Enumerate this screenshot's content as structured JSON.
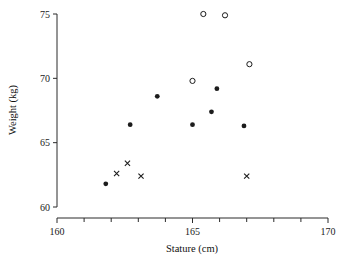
{
  "chart_data": {
    "type": "scatter",
    "title": "",
    "xlabel": "Stature (cm)",
    "ylabel": "Weight (kg)",
    "xlim": [
      160,
      170
    ],
    "ylim": [
      60,
      75
    ],
    "xticks": [
      160,
      165,
      170
    ],
    "xtick_labels": [
      "160",
      "165",
      "170"
    ],
    "xminor_ticks": [
      161,
      162,
      163,
      164,
      166,
      167,
      168,
      169
    ],
    "yticks": [
      60,
      65,
      70,
      75
    ],
    "ytick_labels": [
      "60",
      "65",
      "70",
      "75"
    ],
    "grid": false,
    "legend": null,
    "series": [
      {
        "name": "filled-circle",
        "marker": "filled-circle",
        "color": "#1c1c1c",
        "points": [
          {
            "x": 161.8,
            "y": 61.8
          },
          {
            "x": 162.7,
            "y": 66.4
          },
          {
            "x": 163.7,
            "y": 68.6
          },
          {
            "x": 165.0,
            "y": 66.4
          },
          {
            "x": 165.7,
            "y": 67.4
          },
          {
            "x": 165.9,
            "y": 69.2
          },
          {
            "x": 166.9,
            "y": 66.3
          }
        ]
      },
      {
        "name": "open-circle",
        "marker": "open-circle",
        "color": "#1c1c1c",
        "points": [
          {
            "x": 165.0,
            "y": 69.8
          },
          {
            "x": 165.4,
            "y": 75.0
          },
          {
            "x": 166.2,
            "y": 74.9
          },
          {
            "x": 167.1,
            "y": 71.1
          }
        ]
      },
      {
        "name": "cross",
        "marker": "x",
        "color": "#1c1c1c",
        "points": [
          {
            "x": 162.2,
            "y": 62.6
          },
          {
            "x": 162.6,
            "y": 63.4
          },
          {
            "x": 163.1,
            "y": 62.4
          },
          {
            "x": 167.0,
            "y": 62.4
          }
        ]
      }
    ]
  },
  "axes": {
    "x_title": "Stature (cm)",
    "y_title": "Weight (kg)"
  },
  "colors": {
    "ink": "#1c1c1c",
    "axis": "#2b2b2b",
    "background": "#ffffff"
  }
}
